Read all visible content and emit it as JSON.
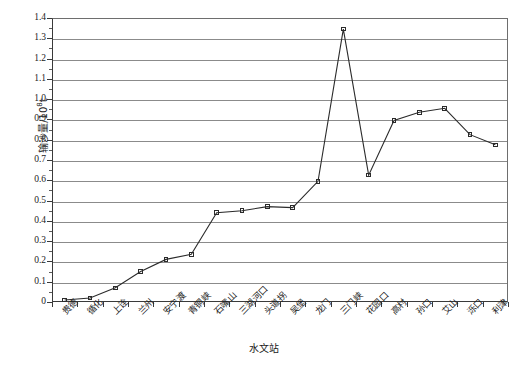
{
  "chart_data": {
    "type": "line",
    "title": "",
    "xlabel": "水文站",
    "ylabel": "输沙量/10⁸t",
    "ylabel_base": "输沙量/10",
    "ylabel_exp": "8",
    "ylabel_unit": "t",
    "ylim": [
      0,
      1.4
    ],
    "ytick_step": 0.1,
    "grid": true,
    "legend": "none",
    "marker": "open-square",
    "line_color": "#2b2b2b",
    "grid_color": "#8b8b8b",
    "axis_color": "#3a3a3a",
    "categories": [
      "贵德",
      "循化",
      "上诠",
      "兰州",
      "安宁渡",
      "青铜峡",
      "石嘴山",
      "三湖河口",
      "头道拐",
      "吴堡",
      "龙门",
      "三门峡",
      "花园口",
      "高村",
      "孙口",
      "艾山",
      "泺口",
      "利津"
    ],
    "values": [
      0.01,
      0.02,
      0.07,
      0.15,
      0.21,
      0.235,
      0.44,
      0.45,
      0.47,
      0.465,
      0.595,
      1.345,
      0.625,
      0.895,
      0.935,
      0.955,
      0.825,
      0.775
    ],
    "ytick_labels": [
      "0",
      "0.1",
      "0.2",
      "0.3",
      "0.4",
      "0.5",
      "0.6",
      "0.7",
      "0.8",
      "0.9",
      "1.0",
      "1.1",
      "1.2",
      "1.3",
      "1.4"
    ],
    "ytick_values": [
      0,
      0.1,
      0.2,
      0.3,
      0.4,
      0.5,
      0.6,
      0.7,
      0.8,
      0.9,
      1.0,
      1.1,
      1.2,
      1.3,
      1.4
    ]
  }
}
